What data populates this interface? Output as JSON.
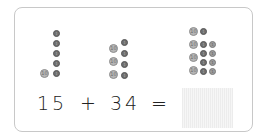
{
  "equation": {
    "addend1": "15",
    "operator_plus": "+",
    "addend2": "34",
    "operator_equals": "=",
    "answer": ""
  },
  "coin_labels": {
    "ten": "10",
    "one": "1"
  },
  "groups": [
    {
      "name": "group-15",
      "tens": 1,
      "ones": 5
    },
    {
      "name": "group-34",
      "tens": 3,
      "ones": 4
    },
    {
      "name": "group-49",
      "tens": 4,
      "ones": 7
    }
  ],
  "colors": {
    "card_border": "#c8c8c8",
    "ten_coin": "#b5b5b5",
    "one_coin_dark": "#6f6f6f",
    "one_coin_light": "#9c9c9c",
    "answer_box": "#eeeeee"
  }
}
